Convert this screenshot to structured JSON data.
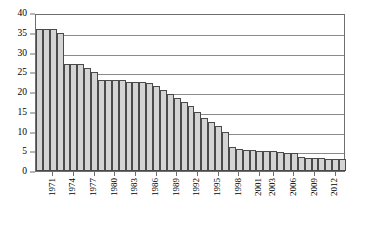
{
  "chart_data": {
    "type": "bar",
    "title": "",
    "subtitle": "",
    "xlabel": "",
    "ylabel": "",
    "ylim": [
      0,
      40
    ],
    "ytick_values": [
      0,
      5,
      10,
      15,
      20,
      25,
      30,
      35,
      40
    ],
    "ytick_labels": [
      "0",
      "5",
      "10",
      "15",
      "20",
      "25",
      "30",
      "35",
      "40"
    ],
    "grid": "horizontal",
    "legend": "none",
    "bar_fill_color": "#d4d4d4",
    "bar_edge_color": "#4a4a4a",
    "gridline_color": "#8a8a8a",
    "categories": [
      "1969",
      "1970",
      "1971",
      "1972",
      "1973",
      "1974",
      "1975",
      "1976",
      "1977",
      "1978",
      "1979",
      "1980",
      "1981",
      "1982",
      "1983",
      "1984",
      "1985",
      "1986",
      "1987",
      "1988",
      "1989",
      "1990",
      "1991",
      "1992",
      "1993",
      "1994",
      "1995",
      "1996",
      "1997",
      "1998",
      "1999",
      "2000",
      "2001",
      "2002",
      "2003",
      "2004",
      "2005",
      "2006",
      "2007",
      "2008",
      "2009",
      "2010",
      "2011",
      "2012",
      "2013"
    ],
    "values": [
      36,
      36,
      36,
      35,
      27,
      27,
      27,
      26,
      25,
      23,
      23,
      23,
      23,
      22.5,
      22.5,
      22.5,
      22.3,
      21.5,
      20.5,
      19.5,
      18.5,
      17.5,
      16.5,
      15,
      13.5,
      12.5,
      11.5,
      10,
      6,
      5.5,
      5.3,
      5.2,
      5.1,
      5,
      5,
      4.8,
      4.6,
      4.5,
      3.5,
      3.4,
      3.3,
      3.2,
      3.1,
      3,
      3
    ],
    "xtick_labels": [
      {
        "label": "1971",
        "index": 2
      },
      {
        "label": "1974",
        "index": 5
      },
      {
        "label": "1977",
        "index": 8
      },
      {
        "label": "1980",
        "index": 11
      },
      {
        "label": "1983",
        "index": 14
      },
      {
        "label": "1986",
        "index": 17
      },
      {
        "label": "1989",
        "index": 20
      },
      {
        "label": "1992",
        "index": 23
      },
      {
        "label": "1995",
        "index": 26
      },
      {
        "label": "1998",
        "index": 29
      },
      {
        "label": "2001",
        "index": 32
      },
      {
        "label": "2003",
        "index": 34
      },
      {
        "label": "2006",
        "index": 37
      },
      {
        "label": "2009",
        "index": 40
      },
      {
        "label": "2012",
        "index": 43
      }
    ]
  }
}
